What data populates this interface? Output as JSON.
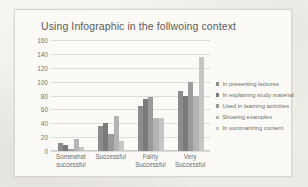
{
  "chart_data": {
    "type": "bar",
    "title": "Using Infographic in the follwoing context",
    "xlabel": "",
    "ylabel": "",
    "ylim": [
      0,
      160
    ],
    "ytick_step": 20,
    "yticks": [
      160,
      140,
      120,
      100,
      80,
      60,
      40,
      20,
      0
    ],
    "grid": true,
    "legend_position": "right",
    "categories": [
      "Somewhat successful",
      "Successful",
      "Fairly Successful",
      "Very Successful"
    ],
    "category_lines": [
      [
        "Somewhat",
        "successful"
      ],
      [
        "Successful",
        ""
      ],
      [
        "Fairly",
        "Successful"
      ],
      [
        "Very",
        "Successful"
      ]
    ],
    "series": [
      {
        "name": "In presenting lectures",
        "color": "#8c8c8c",
        "values": [
          12,
          36,
          65,
          87
        ]
      },
      {
        "name": "In explaining study material",
        "color": "#7a7a7a",
        "values": [
          8,
          41,
          75,
          79
        ]
      },
      {
        "name": "Used in learning activities",
        "color": "#9a9a9a",
        "values": [
          3,
          25,
          78,
          100
        ]
      },
      {
        "name": "Showing examples",
        "color": "#b4b4b4",
        "values": [
          17,
          50,
          48,
          80
        ]
      },
      {
        "name": "In summarizing content",
        "color": "#c6c6c6",
        "values": [
          6,
          15,
          48,
          136
        ]
      }
    ]
  },
  "theme": {
    "page_background": "#f2f1ed",
    "chart_background": "#fbfaf7",
    "frame_border": "#d8d6d0",
    "gridline": "#ddddd7",
    "text": "#6e6d66",
    "title_text": "#5c5b57"
  }
}
